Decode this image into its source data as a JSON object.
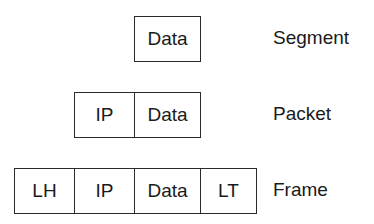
{
  "rows": [
    {
      "name": "Segment",
      "cells": [
        "Data"
      ]
    },
    {
      "name": "Packet",
      "cells": [
        "IP",
        "Data"
      ]
    },
    {
      "name": "Frame",
      "cells": [
        "LH",
        "IP",
        "Data",
        "LT"
      ]
    }
  ]
}
